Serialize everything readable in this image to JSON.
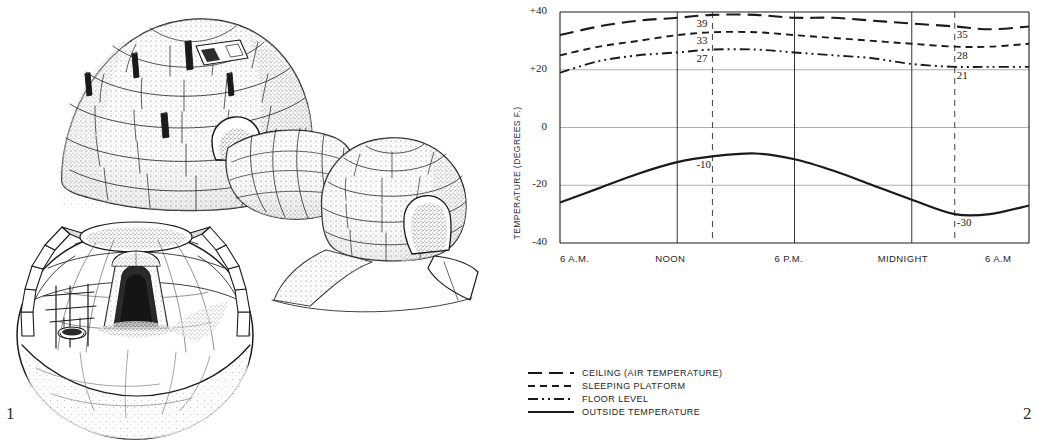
{
  "figure": {
    "panel_1_number": "1",
    "panel_2_number": "2",
    "illustration_name": "igloo-cutaway-illustration"
  },
  "chart_data": {
    "type": "line",
    "title": "",
    "xlabel": "",
    "ylabel": "TEMPERATURE (DEGREES F.)",
    "xlim": [
      0,
      24
    ],
    "ylim": [
      -40,
      40
    ],
    "y_ticks": [
      "+40",
      "+20",
      "0",
      "-20",
      "-40"
    ],
    "y_tick_values": [
      40,
      20,
      0,
      -20,
      -40
    ],
    "x_ticks": [
      "6 A.M.",
      "NOON",
      "6 P.M.",
      "MIDNIGHT",
      "6 A.M"
    ],
    "x_tick_values": [
      0,
      6,
      12,
      18,
      24
    ],
    "grid": true,
    "legend_position": "below",
    "annotations": [
      {
        "text": "39",
        "series": "CEILING (AIR TEMPERATURE)",
        "x": 7.8,
        "y": 39
      },
      {
        "text": "33",
        "series": "SLEEPING PLATFORM",
        "x": 7.8,
        "y": 33
      },
      {
        "text": "27",
        "series": "FLOOR LEVEL",
        "x": 7.8,
        "y": 27
      },
      {
        "text": "-10",
        "series": "OUTSIDE TEMPERATURE",
        "x": 7.8,
        "y": -10
      },
      {
        "text": "35",
        "series": "CEILING (AIR TEMPERATURE)",
        "x": 20.2,
        "y": 35
      },
      {
        "text": "28",
        "series": "SLEEPING PLATFORM",
        "x": 20.2,
        "y": 28
      },
      {
        "text": "21",
        "series": "FLOOR LEVEL",
        "x": 20.2,
        "y": 21
      },
      {
        "text": "-30",
        "series": "OUTSIDE TEMPERATURE",
        "x": 20.2,
        "y": -30
      }
    ],
    "series": [
      {
        "name": "CEILING (AIR TEMPERATURE)",
        "style": "long-dash",
        "x": [
          0,
          2,
          4,
          6,
          7.8,
          10,
          12,
          14,
          16,
          18,
          20.2,
          22,
          24
        ],
        "values": [
          32,
          35,
          37,
          38,
          39,
          39,
          38,
          38,
          37,
          36,
          35,
          34,
          35
        ]
      },
      {
        "name": "SLEEPING PLATFORM",
        "style": "short-dash",
        "x": [
          0,
          2,
          4,
          6,
          7.8,
          10,
          12,
          14,
          16,
          18,
          20.2,
          22,
          24
        ],
        "values": [
          25,
          28,
          30,
          32,
          33,
          33,
          32,
          31,
          30,
          29,
          28,
          28,
          29
        ]
      },
      {
        "name": "FLOOR LEVEL",
        "style": "dash-dot-dot",
        "x": [
          0,
          2,
          4,
          6,
          7.8,
          10,
          12,
          14,
          16,
          18,
          20.2,
          22,
          24
        ],
        "values": [
          19,
          23,
          25,
          26,
          27,
          27,
          26,
          25,
          24,
          22,
          21,
          21,
          21
        ]
      },
      {
        "name": "OUTSIDE TEMPERATURE",
        "style": "solid",
        "x": [
          0,
          2,
          4,
          6,
          7.8,
          10,
          12,
          14,
          16,
          18,
          20.2,
          22,
          24
        ],
        "values": [
          -26,
          -21,
          -16,
          -12,
          -10,
          -9,
          -11,
          -15,
          -20,
          -25,
          -30,
          -30,
          -27
        ]
      }
    ]
  },
  "legend": {
    "items": [
      {
        "label": "CEILING (AIR TEMPERATURE)",
        "style": "long-dash"
      },
      {
        "label": "SLEEPING PLATFORM",
        "style": "short-dash"
      },
      {
        "label": "FLOOR LEVEL",
        "style": "dash-dot-dot"
      },
      {
        "label": "OUTSIDE TEMPERATURE",
        "style": "solid"
      }
    ]
  }
}
